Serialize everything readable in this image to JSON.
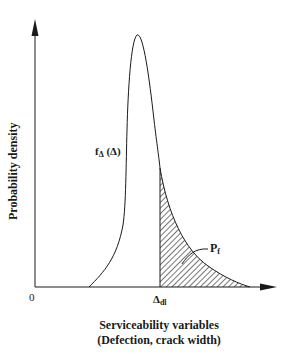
{
  "diagram": {
    "y_axis_label": "Probability density",
    "x_axis_label_line1": "Serviceability variables",
    "x_axis_label_line2": "(Defection, crack width)",
    "origin_label": "0",
    "curve_label_main": "f",
    "curve_label_sub": "Δ",
    "curve_label_arg": " (Δ)",
    "threshold_label_main": "Δ",
    "threshold_label_sub": "dl",
    "failure_prob_label_main": "P",
    "failure_prob_label_sub": "f"
  },
  "colors": {
    "line": "#1a1a1a",
    "background": "#ffffff"
  }
}
